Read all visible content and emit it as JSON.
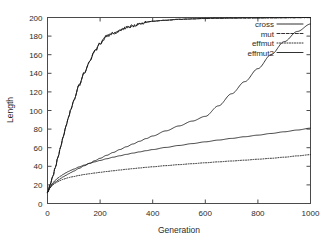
{
  "chart_data": {
    "type": "line",
    "title": "",
    "xlabel": "Generation",
    "ylabel": "Length",
    "xlim": [
      0,
      1000
    ],
    "ylim": [
      0,
      200
    ],
    "xticks": [
      0,
      200,
      400,
      600,
      800,
      1000
    ],
    "yticks": [
      0,
      20,
      40,
      60,
      80,
      100,
      120,
      140,
      160,
      180,
      200
    ],
    "grid": false,
    "legend_position": "top-right",
    "x": [
      0,
      10,
      20,
      30,
      40,
      50,
      60,
      70,
      80,
      90,
      100,
      120,
      140,
      160,
      180,
      200,
      225,
      250,
      275,
      300,
      325,
      350,
      375,
      400,
      450,
      500,
      550,
      600,
      650,
      700,
      750,
      800,
      850,
      900,
      950,
      1000
    ],
    "series": [
      {
        "name": "cross",
        "style": "solid",
        "values": [
          12,
          20,
          29,
          39,
          50,
          61,
          72,
          83,
          93,
          102,
          111,
          127,
          141,
          153,
          164,
          172,
          180,
          183,
          186,
          189,
          191,
          193,
          195,
          196,
          197,
          198,
          198.5,
          199,
          199.2,
          199.4,
          199.5,
          199.6,
          199.7,
          199.8,
          199.9,
          200
        ]
      },
      {
        "name": "mut",
        "style": "dashed",
        "values": [
          12,
          20,
          29,
          39,
          50,
          61,
          72,
          83,
          93,
          102,
          111,
          127,
          141,
          153,
          164,
          172,
          180,
          183,
          186,
          189,
          191,
          193,
          195,
          196,
          197,
          198,
          198.5,
          199,
          199.2,
          199.4,
          199.5,
          199.6,
          199.7,
          199.8,
          199.9,
          200
        ]
      },
      {
        "name": "effmut",
        "style": "dotted",
        "values": [
          12,
          17,
          20,
          22,
          23.5,
          25,
          26,
          27,
          27.8,
          28.5,
          29,
          30.2,
          31.2,
          32,
          32.8,
          33.5,
          34.4,
          35.2,
          36,
          36.8,
          37.5,
          38.2,
          38.9,
          39.5,
          40.7,
          41.8,
          42.8,
          43.8,
          44.8,
          45.7,
          46.6,
          47.6,
          48.6,
          49.8,
          51.2,
          52.5
        ]
      },
      {
        "name": "effmut2",
        "style": "solid",
        "values": [
          12,
          18,
          22,
          25,
          27.5,
          29.5,
          31.3,
          33,
          34.5,
          35.8,
          37,
          39.3,
          41.3,
          43.1,
          44.8,
          46.3,
          48.1,
          49.8,
          51.3,
          52.8,
          54.2,
          55.5,
          56.8,
          58,
          60.3,
          62.4,
          64.4,
          66.3,
          68.2,
          70,
          71.8,
          73.5,
          75.3,
          77.1,
          79,
          81
        ]
      },
      {
        "name": "effmut2-upper",
        "style": "solid",
        "values": [
          12,
          17,
          20.5,
          23,
          25,
          27,
          28.7,
          30.3,
          31.9,
          33.4,
          34.9,
          37.8,
          40.6,
          43.3,
          46,
          48.6,
          51.8,
          54.9,
          58,
          61,
          64,
          66.9,
          69.8,
          72.6,
          78.1,
          83.4,
          88.6,
          93.7,
          105,
          118,
          131,
          145,
          160,
          174,
          185,
          193
        ]
      }
    ],
    "legend": [
      {
        "label": "cross",
        "style": "solid"
      },
      {
        "label": "mut",
        "style": "dashed"
      },
      {
        "label": "effmut",
        "style": "dotted"
      },
      {
        "label": "effmut2",
        "style": "solid"
      }
    ]
  },
  "colors": {
    "line": "#1a1a1a",
    "axis": "#4a4a4a",
    "text": "#2b2b2b",
    "background": "#ffffff"
  }
}
